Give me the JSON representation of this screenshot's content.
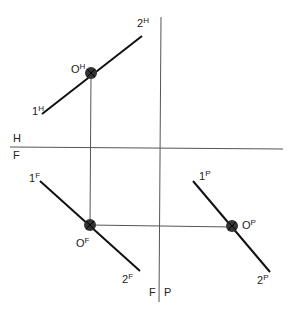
{
  "planes": {
    "hf_top": "H",
    "hf_bottom": "F",
    "fp_left": "F",
    "fp_right": "P"
  },
  "points": {
    "h1": {
      "base": "1",
      "sup": "H"
    },
    "h2": {
      "base": "2",
      "sup": "H"
    },
    "hO": {
      "base": "O",
      "sup": "H"
    },
    "f1": {
      "base": "1",
      "sup": "F"
    },
    "f2": {
      "base": "2",
      "sup": "F"
    },
    "fO": {
      "base": "O",
      "sup": "F"
    },
    "p1": {
      "base": "1",
      "sup": "P"
    },
    "p2": {
      "base": "2",
      "sup": "P"
    },
    "pO": {
      "base": "O",
      "sup": "P"
    }
  },
  "colors": {
    "line": "#111111",
    "thin": "#555555",
    "dot": "#333333"
  }
}
